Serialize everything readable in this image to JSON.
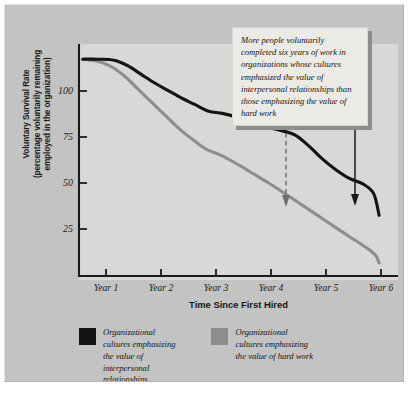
{
  "figure": {
    "background_color": "#c3c3c3",
    "plot_background_color": "#d8d8d6"
  },
  "annotation": {
    "text": "More people voluntarily completed six years of work in organizations whose cultures emphasized the value of interpersonal relationships than those emphasizing the value of hard work",
    "arrow_dashed_name": "arrow-to-hard-work-line",
    "arrow_solid_name": "arrow-to-interpersonal-line"
  },
  "legend": {
    "entries": [
      {
        "label": "Organizational\ncultures emphasizing\nthe value of\ninterpersonal\nrelationships",
        "color": "#141414"
      },
      {
        "label": "Organizational\ncultures emphasizing\nthe value of hard work",
        "color": "#8e8e8e"
      }
    ]
  },
  "chart_data": {
    "type": "line",
    "title": "",
    "xlabel": "Time Since First Hired",
    "ylabel": "Voluntary Survival Rate\n(percentage voluntarily remaining\nemployed in the organization)",
    "ylabel_lines": [
      "Voluntary Survival Rate",
      "(percentage voluntarily remaining",
      "employed in the organization)"
    ],
    "xtick_labels": [
      "Year 1",
      "Year 2",
      "Year 3",
      "Year 4",
      "Year 5",
      "Year 6"
    ],
    "xticks": [
      1,
      2,
      3,
      4,
      5,
      6
    ],
    "ytick_labels": [
      "100",
      "75",
      "50",
      "25"
    ],
    "yticks": [
      100,
      75,
      50,
      25
    ],
    "ylim": [
      0,
      107
    ],
    "xlim": [
      0.55,
      6.45
    ],
    "grid": false,
    "legend_position": "below",
    "series": [
      {
        "name": "Organizational cultures emphasizing the value of interpersonal relationships",
        "color": "#141414",
        "x": [
          0.62,
          0.9,
          1.2,
          1.45,
          1.7,
          1.95,
          2.2,
          2.45,
          2.7,
          2.95,
          3.2,
          3.5,
          3.8,
          4.05,
          4.3,
          4.55,
          4.8,
          5.05,
          5.3,
          5.55,
          5.8,
          6.0,
          6.1
        ],
        "values": [
          100,
          100,
          99.5,
          97,
          93,
          89,
          85.5,
          82,
          79,
          76,
          75,
          73,
          70.5,
          68.5,
          67,
          65,
          60,
          54,
          49,
          45,
          42.5,
          38,
          28
        ]
      },
      {
        "name": "Organizational cultures emphasizing the value of hard work",
        "color": "#8e8e8e",
        "x": [
          0.62,
          0.9,
          1.15,
          1.4,
          1.65,
          1.9,
          2.15,
          2.4,
          2.65,
          2.9,
          3.15,
          3.45,
          3.75,
          4.05,
          4.3,
          4.6,
          4.9,
          5.2,
          5.5,
          5.75,
          5.95,
          6.05,
          6.1
        ],
        "values": [
          100,
          99,
          96.5,
          92,
          86,
          80,
          74,
          68,
          63,
          58.5,
          56,
          52,
          47.5,
          43,
          39,
          34,
          29,
          24,
          19,
          15,
          11.5,
          9,
          6
        ]
      }
    ]
  }
}
